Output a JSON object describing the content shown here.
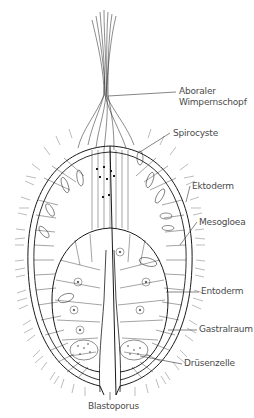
{
  "diagram": {
    "labels": [
      {
        "id": "aboral",
        "line1": "Aboraler",
        "line2": "Wimpernschopf"
      },
      {
        "id": "spirocyste",
        "text": "Spirocyste"
      },
      {
        "id": "ektoderm",
        "text": "Ektoderm"
      },
      {
        "id": "mesogloea",
        "text": "Mesogloea"
      },
      {
        "id": "entoderm",
        "text": "Entoderm"
      },
      {
        "id": "gastralraum",
        "text": "Gastralraum"
      },
      {
        "id": "druesenzelle",
        "text": "Drüsenzelle"
      },
      {
        "id": "blastoporus",
        "text": "Blastoporus"
      }
    ],
    "colors": {
      "line": "#1a1a1a",
      "label": "#4a4a4a",
      "leader": "#333333",
      "background": "#ffffff"
    }
  }
}
